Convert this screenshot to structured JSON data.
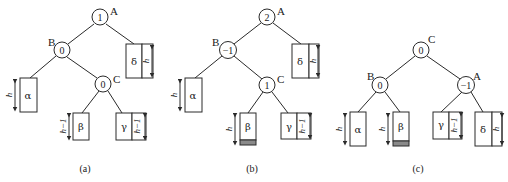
{
  "figure": {
    "panels": [
      {
        "caption": "(a)",
        "nodes": [
          {
            "name": "A",
            "balance": "1"
          },
          {
            "name": "B",
            "balance": "0"
          },
          {
            "name": "C",
            "balance": "0"
          }
        ],
        "subtrees": [
          {
            "name": "α",
            "height": "h"
          },
          {
            "name": "β",
            "height": "h−1"
          },
          {
            "name": "γ",
            "height": "h−1"
          },
          {
            "name": "δ",
            "height": "h"
          }
        ]
      },
      {
        "caption": "(b)",
        "nodes": [
          {
            "name": "A",
            "balance": "2"
          },
          {
            "name": "B",
            "balance": "−1"
          },
          {
            "name": "C",
            "balance": "1"
          }
        ],
        "subtrees": [
          {
            "name": "α",
            "height": "h"
          },
          {
            "name": "β",
            "height": "h"
          },
          {
            "name": "γ",
            "height": "h−1"
          },
          {
            "name": "δ",
            "height": "h"
          }
        ]
      },
      {
        "caption": "(c)",
        "nodes": [
          {
            "name": "C",
            "balance": "0"
          },
          {
            "name": "B",
            "balance": "0"
          },
          {
            "name": "A",
            "balance": "−1"
          }
        ],
        "subtrees": [
          {
            "name": "α",
            "height": "h"
          },
          {
            "name": "β",
            "height": "h"
          },
          {
            "name": "γ",
            "height": "h−1"
          },
          {
            "name": "δ",
            "height": "h"
          }
        ]
      }
    ],
    "colors": {
      "line": "#2a2a2a",
      "inserted_node_fill": "#8a8a8a",
      "background": "#ffffff"
    }
  }
}
